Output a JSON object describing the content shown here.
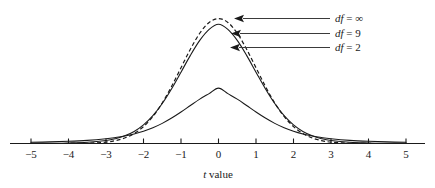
{
  "chart_data": {
    "type": "line",
    "title": "",
    "subtitle": "",
    "xlabel": "t value",
    "xlabel_italic_part": "t",
    "xlabel_rest": " value",
    "ylabel": "",
    "xlim": [
      -5,
      5
    ],
    "ylim": [
      0,
      0.42
    ],
    "grid": false,
    "legend_position": "right-inline-annotations",
    "xticks": [
      -5,
      -4,
      -3,
      -2,
      -1,
      0,
      1,
      2,
      3,
      4,
      5
    ],
    "xtick_labels": [
      "−5",
      "−4",
      "−3",
      "−2",
      "−1",
      "0",
      "1",
      "2",
      "3",
      "4",
      "5"
    ],
    "yticks": [],
    "ytick_labels": [],
    "series": [
      {
        "name": "df = ∞",
        "label_italic_part": "df",
        "label_rest": " = ∞",
        "df": "infinity",
        "style": "dashed",
        "color": "#1a1a1a",
        "peak_value": 0.3989,
        "x": [
          -5,
          -4.5,
          -4,
          -3.5,
          -3,
          -2.75,
          -2.5,
          -2.25,
          -2,
          -1.75,
          -1.5,
          -1.25,
          -1,
          -0.75,
          -0.5,
          -0.25,
          0,
          0.25,
          0.5,
          0.75,
          1,
          1.25,
          1.5,
          1.75,
          2,
          2.25,
          2.5,
          2.75,
          3,
          3.5,
          4,
          4.5,
          5
        ],
        "y": [
          1.5e-06,
          1.6e-05,
          0.0001338,
          0.0008727,
          0.0044318,
          0.0090936,
          0.0175283,
          0.031658,
          0.053991,
          0.0862773,
          0.1295176,
          0.1826491,
          0.2419707,
          0.3011374,
          0.3520653,
          0.3866681,
          0.3989423,
          0.3866681,
          0.3520653,
          0.3011374,
          0.2419707,
          0.1826491,
          0.1295176,
          0.0862773,
          0.053991,
          0.031658,
          0.0175283,
          0.0090936,
          0.0044318,
          0.0008727,
          0.0001338,
          1.6e-05,
          1.5e-06
        ]
      },
      {
        "name": "df = 9",
        "label_italic_part": "df",
        "label_rest": " = 9",
        "df": 9,
        "style": "solid",
        "color": "#1a1a1a",
        "peak_value": 0.388,
        "x": [
          -5,
          -4.5,
          -4,
          -3.5,
          -3,
          -2.75,
          -2.5,
          -2.25,
          -2,
          -1.75,
          -1.5,
          -1.25,
          -1,
          -0.75,
          -0.5,
          -0.25,
          0,
          0.25,
          0.5,
          0.75,
          1,
          1.25,
          1.5,
          1.75,
          2,
          2.25,
          2.5,
          2.75,
          3,
          3.5,
          4,
          4.5,
          5
        ],
        "y": [
          0.000363,
          0.000772,
          0.001717,
          0.003999,
          0.009775,
          0.015452,
          0.024527,
          0.03855,
          0.059453,
          0.089022,
          0.127778,
          0.175076,
          0.227882,
          0.28139,
          0.32918,
          0.364318,
          0.380836,
          0.364318,
          0.32918,
          0.28139,
          0.227882,
          0.175076,
          0.127778,
          0.089022,
          0.059453,
          0.03855,
          0.024527,
          0.015452,
          0.009775,
          0.003999,
          0.001717,
          0.000772,
          0.000363
        ]
      },
      {
        "name": "df = 2",
        "label_italic_part": "df",
        "label_rest": " = 2",
        "df": 2,
        "style": "solid",
        "color": "#1a1a1a",
        "peak_value": 0.3536,
        "x": [
          -5,
          -4.5,
          -4,
          -3.5,
          -3,
          -2.75,
          -2.5,
          -2.25,
          -2,
          -1.75,
          -1.5,
          -1.25,
          -1,
          -0.75,
          -0.5,
          -0.25,
          0,
          0.25,
          0.5,
          0.75,
          1,
          1.25,
          1.5,
          1.75,
          2,
          2.25,
          2.5,
          2.75,
          3,
          3.5,
          4,
          4.5,
          5
        ],
        "y": [
          0.003763,
          0.005056,
          0.007029,
          0.010137,
          0.015197,
          0.018943,
          0.0239,
          0.030475,
          0.039124,
          0.050289,
          0.064296,
          0.081181,
          0.100516,
          0.121268,
          0.141691,
          0.159329,
          0.176777,
          0.159329,
          0.141691,
          0.121268,
          0.100516,
          0.081181,
          0.064296,
          0.050289,
          0.039124,
          0.030475,
          0.0239,
          0.018943,
          0.015197,
          0.010137,
          0.007029,
          0.005056,
          0.003763
        ]
      }
    ],
    "annotations": [
      {
        "text": "df = ∞",
        "italic": "df",
        "rest": " = ∞",
        "points_to_series": "df = ∞"
      },
      {
        "text": "df = 9",
        "italic": "df",
        "rest": " = 9",
        "points_to_series": "df = 9"
      },
      {
        "text": "df = 2",
        "italic": "df",
        "rest": " = 2",
        "points_to_series": "df = 2"
      }
    ],
    "colors": {
      "curve": "#1a1a1a",
      "axis": "#1a1a1a",
      "leader": "#3a3a3a",
      "background": "#ffffff"
    }
  }
}
